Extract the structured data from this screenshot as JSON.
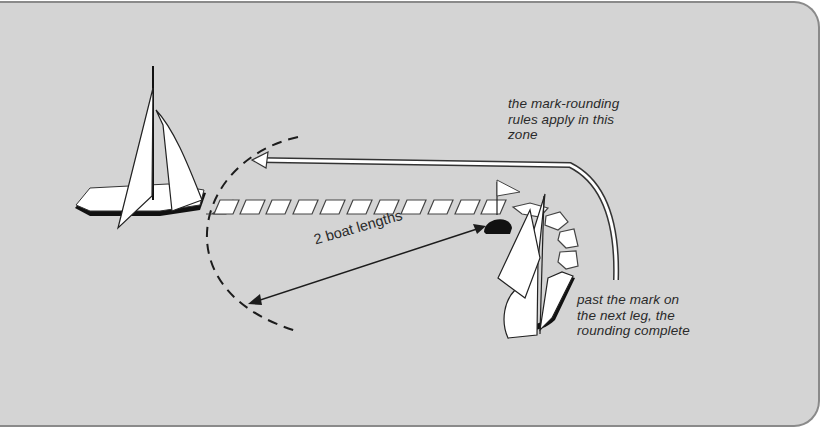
{
  "diagram": {
    "type": "sailing mark-rounding illustration",
    "colors": {
      "background": "#d4d4d4",
      "border": "#8a8a8a",
      "ink": "#1c1c1c",
      "sail": "#ffffff"
    },
    "labels": {
      "zone_note": [
        "the mark-rounding",
        "rules apply in this",
        "zone"
      ],
      "complete_note": [
        "past the mark on",
        "the next leg, the",
        "rounding complete"
      ],
      "distance": "2 boat lengths"
    },
    "elements": {
      "boat_left": "sailboat approaching",
      "boat_right": "sailboat rounding mark",
      "mark": "black buoy with flag",
      "zone_boundary": "dashed arc at two boat lengths",
      "track": "hull footprints along path",
      "arrow_course": "curved white arrow showing course"
    }
  }
}
